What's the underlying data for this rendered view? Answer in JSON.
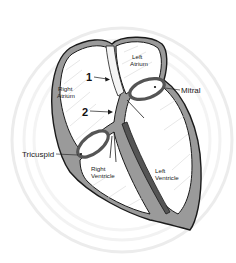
{
  "diagram": {
    "colors": {
      "background": "#ffffff",
      "swirl": "#ececec",
      "wall": "#9a9a9a",
      "outline": "#1a1a1a",
      "chamber": "#ffffff",
      "septum_dark": "#555555",
      "text": "#222222"
    },
    "labels": {
      "left_atrium_1": "Left",
      "left_atrium_2": "Atrium",
      "right_atrium_1": "Right",
      "right_atrium_2": "Atrium",
      "right_ventricle_1": "Right",
      "right_ventricle_2": "Ventricle",
      "left_ventricle_1": "Left",
      "left_ventricle_2": "Ventricle",
      "mitral": "Mitral",
      "tricuspid": "Tricuspid",
      "marker_1": "1",
      "marker_2": "2"
    }
  }
}
